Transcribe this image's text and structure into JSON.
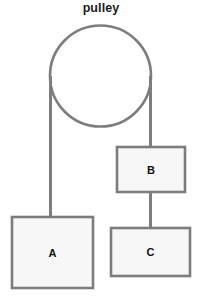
{
  "figure": {
    "title": "pulley",
    "type": "physics-free-body-diagram",
    "canvas": {
      "width": 202,
      "height": 299,
      "background": "#ffffff"
    },
    "style": {
      "stroke_color": "#7d7d7d",
      "block_fill": "#f7f7f7",
      "rope_color": "#7d7d7d",
      "text_color": "#111111",
      "title_color": "#1b1b1b",
      "stroke_width": 2.6,
      "rope_width": 3.0
    },
    "pulley": {
      "name": "pulley",
      "label": "pulley",
      "center_x": 100.5,
      "center_y": 76,
      "radius": 50.5
    },
    "blocks": [
      {
        "id": "A",
        "label": "A",
        "x": 12,
        "y": 217,
        "width": 81,
        "height": 71,
        "label_x": 52.5,
        "label_y": 252.5
      },
      {
        "id": "B",
        "label": "B",
        "x": 117,
        "y": 147,
        "width": 68,
        "height": 45,
        "label_x": 151,
        "label_y": 169.5
      },
      {
        "id": "C",
        "label": "C",
        "x": 111,
        "y": 228,
        "width": 79,
        "height": 48,
        "label_x": 150.5,
        "label_y": 252
      }
    ],
    "ropes": [
      {
        "name": "rope-left-to-block-a",
        "x1": 50.5,
        "y1": 76,
        "x2": 50.5,
        "y2": 218
      },
      {
        "name": "rope-right-to-block-b",
        "x1": 150.5,
        "y1": 76,
        "x2": 150.5,
        "y2": 148
      },
      {
        "name": "rope-block-b-to-block-c",
        "x1": 150.5,
        "y1": 191,
        "x2": 150.5,
        "y2": 229
      }
    ]
  }
}
